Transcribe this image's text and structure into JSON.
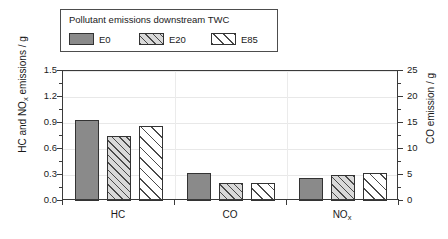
{
  "legend": {
    "title": "Pollutant emissions downstream TWC",
    "entries": [
      {
        "label": "E0",
        "style": "solid",
        "color": "#8a8a8a"
      },
      {
        "label": "E20",
        "style": "hatch-light",
        "color": "#d9d9d9"
      },
      {
        "label": "E85",
        "style": "hatch-white",
        "color": "#ffffff"
      }
    ]
  },
  "chart_data": {
    "type": "bar",
    "title": "Pollutant emissions downstream TWC",
    "categories": [
      "HC",
      "CO",
      "NOx"
    ],
    "category_labels": [
      "HC",
      "CO",
      "NO"
    ],
    "category_subscripts": [
      "",
      "",
      "x"
    ],
    "series": [
      {
        "name": "E0",
        "values": [
          0.94,
          0.32,
          0.26
        ]
      },
      {
        "name": "E20",
        "values": [
          0.75,
          0.21,
          0.305
        ]
      },
      {
        "name": "E85",
        "values": [
          0.86,
          0.21,
          0.325
        ]
      }
    ],
    "co_axis_values": {
      "E0": 5.4,
      "E20": 3.5,
      "E85": 3.5
    },
    "xlabel": "",
    "ylabel": "HC and NOx emissions / g",
    "ylabel_left": "HC and NO",
    "ylabel_left_sub": "x",
    "ylabel_left_tail": " emissions / g",
    "ylabel_right": "CO emission / g",
    "ylim": [
      0.0,
      1.5
    ],
    "yticks": [
      "0.0",
      "0.3",
      "0.6",
      "0.9",
      "1.2",
      "1.5"
    ],
    "ytick_values": [
      0.0,
      0.3,
      0.6,
      0.9,
      1.2,
      1.5
    ],
    "y2lim": [
      0,
      25
    ],
    "y2ticks": [
      "0",
      "5",
      "10",
      "15",
      "20",
      "25"
    ],
    "y2tick_values": [
      0,
      5,
      10,
      15,
      20,
      25
    ],
    "grid": true,
    "legend_position": "above-plot"
  }
}
